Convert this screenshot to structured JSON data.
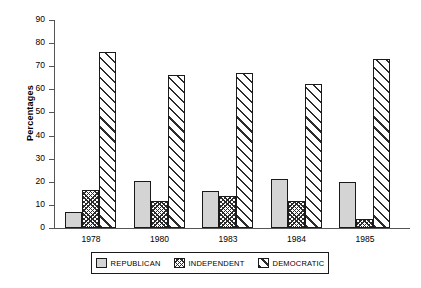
{
  "chart_data": {
    "type": "bar",
    "title": "",
    "xlabel": "",
    "ylabel": "Percentages",
    "ylim": [
      0,
      90
    ],
    "ytick_step": 10,
    "yticks": [
      90,
      80,
      70,
      60,
      50,
      40,
      30,
      20,
      10,
      0
    ],
    "grid": false,
    "legend_position": "bottom",
    "categories": [
      "1978",
      "1980",
      "1983",
      "1984",
      "1985"
    ],
    "series": [
      {
        "name": "REPUBLICAN",
        "pattern": "solid-light-grey",
        "values": [
          7,
          20.5,
          16,
          21,
          20
        ]
      },
      {
        "name": "INDEPENDENT",
        "pattern": "cross-hatch",
        "values": [
          16.5,
          11.5,
          14,
          11.5,
          4
        ]
      },
      {
        "name": "DEMOCRATIC",
        "pattern": "diagonal-hatch",
        "values": [
          76,
          66,
          67,
          62.5,
          73
        ]
      }
    ]
  },
  "colors": {
    "republican": "#d4d4d4",
    "hatch": "#2b2b2b",
    "axis": "#555555",
    "outline": "#1a1a1a",
    "background": "#ffffff"
  }
}
